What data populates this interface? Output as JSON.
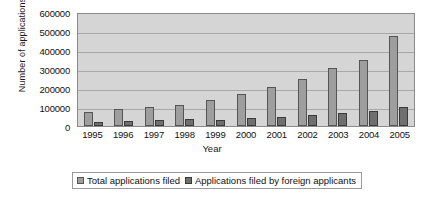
{
  "chart_data": {
    "type": "bar",
    "title": "",
    "xlabel": "Year",
    "ylabel": "Number of applications",
    "categories": [
      "1995",
      "1996",
      "1997",
      "1998",
      "1999",
      "2000",
      "2001",
      "2002",
      "2003",
      "2004",
      "2005"
    ],
    "series": [
      {
        "name": "Total applications  filed",
        "color": "#9e9e9e",
        "values": [
          75000,
          88000,
          98000,
          110000,
          135000,
          170000,
          205000,
          250000,
          305000,
          350000,
          475000
        ]
      },
      {
        "name": "Applications filed by foreign applicants",
        "color": "#6f6f6f",
        "values": [
          22000,
          27000,
          32000,
          35000,
          33000,
          40000,
          48000,
          58000,
          70000,
          78000,
          98000
        ]
      }
    ],
    "ylim": [
      0,
      600000
    ],
    "ytick_values": [
      0,
      100000,
      200000,
      300000,
      400000,
      500000,
      600000
    ],
    "ytick_labels": [
      "0",
      "100000",
      "200000",
      "300000",
      "400000",
      "500000",
      "600000"
    ],
    "grid": true,
    "legend_position": "bottom",
    "plot_background": "#d5d5d5",
    "grid_color": "#a8a8a8",
    "frame_color": "#8a8a8a"
  }
}
